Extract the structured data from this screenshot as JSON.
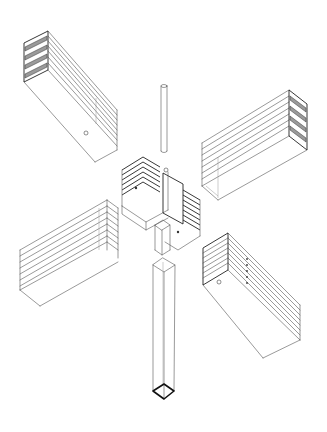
{
  "diagram": {
    "type": "exploded-axonometric",
    "background": "#ffffff",
    "line_color": "#555555",
    "parts": [
      {
        "id": "beam-top-left",
        "label": "beam",
        "position": "upper-left",
        "lamellae": 7,
        "has_pin_hole": true
      },
      {
        "id": "beam-top-right",
        "label": "beam",
        "position": "upper-right",
        "lamellae": 7,
        "has_pin_hole": false
      },
      {
        "id": "beam-bottom-left",
        "label": "beam",
        "position": "lower-left",
        "lamellae": 7,
        "has_pin_hole": false
      },
      {
        "id": "beam-bottom-right",
        "label": "beam",
        "position": "lower-right",
        "lamellae": 7,
        "has_pin_hole": true
      },
      {
        "id": "connector-node",
        "label": "central node",
        "position": "center",
        "fins_per_side": 6
      },
      {
        "id": "pin",
        "label": "steel pin",
        "position": "top-center"
      },
      {
        "id": "column",
        "label": "square column",
        "position": "bottom-center"
      }
    ]
  },
  "geometry": {
    "beam_top_left": {
      "end_face": [
        [
          24,
          43
        ],
        [
          48,
          31
        ],
        [
          48,
          70
        ],
        [
          24,
          82
        ]
      ],
      "body": [
        [
          48,
          31
        ],
        [
          117,
          118
        ],
        [
          117,
          150
        ],
        [
          95,
          162
        ],
        [
          24,
          82
        ]
      ],
      "bottom_edge": [
        [
          24,
          82
        ],
        [
          95,
          162
        ]
      ],
      "hole": [
        86,
        133
      ]
    },
    "beam_top_right": {
      "top": [
        [
          202,
          143
        ],
        [
          289,
          90
        ],
        [
          307,
          104
        ],
        [
          218,
          157
        ]
      ],
      "end_face": [
        [
          289,
          90
        ],
        [
          307,
          104
        ],
        [
          307,
          150
        ],
        [
          289,
          136
        ]
      ],
      "front": [
        [
          202,
          143
        ],
        [
          218,
          157
        ],
        [
          218,
          200
        ],
        [
          202,
          186
        ]
      ],
      "bottom_edge": [
        [
          218,
          200
        ],
        [
          307,
          150
        ]
      ]
    },
    "beam_bottom_left": {
      "top": [
        [
          20,
          250
        ],
        [
          107,
          200
        ],
        [
          118,
          208
        ],
        [
          32,
          258
        ]
      ],
      "end_face": [
        [
          107,
          200
        ],
        [
          118,
          208
        ],
        [
          118,
          258
        ],
        [
          107,
          250
        ]
      ],
      "left_face": [
        [
          20,
          250
        ],
        [
          32,
          258
        ],
        [
          32,
          298
        ],
        [
          20,
          290
        ]
      ],
      "bottom_edge": [
        [
          40,
          306
        ],
        [
          118,
          262
        ]
      ]
    },
    "beam_bottom_right": {
      "end_face": [
        [
          203,
          248
        ],
        [
          228,
          233
        ],
        [
          228,
          270
        ],
        [
          203,
          285
        ]
      ],
      "body": [
        [
          228,
          233
        ],
        [
          300,
          305
        ],
        [
          300,
          340
        ],
        [
          263,
          358
        ],
        [
          203,
          285
        ]
      ],
      "bottom_edge": [
        [
          203,
          285
        ],
        [
          263,
          358
        ]
      ],
      "hole": [
        219,
        282
      ]
    },
    "pin": {
      "x": 161,
      "y1": 85,
      "y2": 152,
      "w": 6
    },
    "column": {
      "top": [
        [
          163,
          258
        ],
        [
          175,
          265
        ],
        [
          164,
          272
        ],
        [
          153,
          265
        ]
      ],
      "bottom": [
        [
          153,
          391
        ],
        [
          164,
          384
        ],
        [
          174,
          391
        ],
        [
          164,
          399
        ]
      ]
    }
  }
}
